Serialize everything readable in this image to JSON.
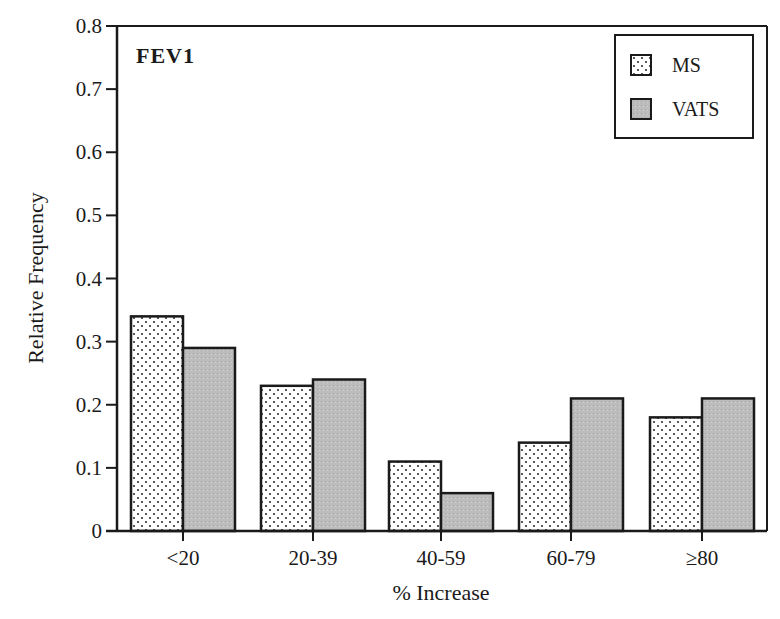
{
  "chart_data": {
    "type": "bar",
    "title": "FEV1",
    "xlabel": "% Increase",
    "ylabel": "Relative Frequency",
    "categories": [
      "<20",
      "20-39",
      "40-59",
      "60-79",
      "≥80"
    ],
    "series": [
      {
        "name": "MS",
        "pattern": "dotted",
        "values": [
          0.34,
          0.23,
          0.11,
          0.14,
          0.18
        ]
      },
      {
        "name": "VATS",
        "pattern": "gray",
        "values": [
          0.29,
          0.24,
          0.06,
          0.21,
          0.21
        ]
      }
    ],
    "ylim": [
      0,
      0.8
    ],
    "yticks": [
      "0",
      "0.1",
      "0.2",
      "0.3",
      "0.4",
      "0.5",
      "0.6",
      "0.7",
      "0.8"
    ],
    "grid": false,
    "legend_position": "upper right"
  },
  "colors": {
    "ms_fill": "#ffffff",
    "ms_dot": "#333333",
    "vats_fill": "#bdbdbd",
    "stroke": "#1a1a1a"
  }
}
